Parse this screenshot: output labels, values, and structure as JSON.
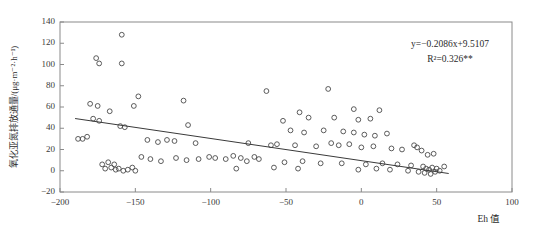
{
  "chart_data": {
    "type": "scatter",
    "title": "",
    "xlabel": "Eh 值",
    "ylabel": "氧化亚氮排放通量/(μg·m⁻²·h⁻¹)",
    "xlim": [
      -200,
      100
    ],
    "ylim": [
      -20,
      140
    ],
    "xticks": [
      -200,
      -150,
      -100,
      -50,
      0,
      50,
      100
    ],
    "xticklabels": [
      "−200",
      "−150",
      "−100",
      "−50",
      "0",
      "50",
      "100"
    ],
    "yticks": [
      -20,
      0,
      20,
      40,
      60,
      80,
      100,
      120,
      140
    ],
    "yticklabels": [
      "−20",
      "0",
      "20",
      "40",
      "60",
      "80",
      "100",
      "120",
      "140"
    ],
    "grid": false,
    "legend": null,
    "marker": "open-circle",
    "annotations": {
      "equation": "y=−0.2086x+9.5107",
      "r_squared": "R²=0.326**",
      "slope": -0.2086,
      "intercept": 9.5107,
      "r2": 0.326,
      "significance": "**"
    },
    "fit_line": {
      "type": "linear",
      "x_start": -190,
      "x_end": 58,
      "y_start": 49.15,
      "y_end": -2.59
    },
    "points": [
      {
        "x": -159,
        "y": 128
      },
      {
        "x": -176,
        "y": 106
      },
      {
        "x": -174,
        "y": 101
      },
      {
        "x": -159,
        "y": 101
      },
      {
        "x": -22,
        "y": 77
      },
      {
        "x": -63,
        "y": 75
      },
      {
        "x": -148,
        "y": 70
      },
      {
        "x": -118,
        "y": 66
      },
      {
        "x": -180,
        "y": 63
      },
      {
        "x": -175,
        "y": 61
      },
      {
        "x": -167,
        "y": 56
      },
      {
        "x": -151,
        "y": 61
      },
      {
        "x": -5,
        "y": 58
      },
      {
        "x": 12,
        "y": 57
      },
      {
        "x": -41,
        "y": 55
      },
      {
        "x": -178,
        "y": 49
      },
      {
        "x": -174,
        "y": 47
      },
      {
        "x": -115,
        "y": 43
      },
      {
        "x": -52,
        "y": 47
      },
      {
        "x": -35,
        "y": 50
      },
      {
        "x": -18,
        "y": 50
      },
      {
        "x": -2,
        "y": 48
      },
      {
        "x": 6,
        "y": 49
      },
      {
        "x": -160,
        "y": 42
      },
      {
        "x": -157,
        "y": 41
      },
      {
        "x": -47,
        "y": 38
      },
      {
        "x": -38,
        "y": 36
      },
      {
        "x": -25,
        "y": 38
      },
      {
        "x": -12,
        "y": 37
      },
      {
        "x": -5,
        "y": 36
      },
      {
        "x": 2,
        "y": 34
      },
      {
        "x": 9,
        "y": 33
      },
      {
        "x": 17,
        "y": 35
      },
      {
        "x": -185,
        "y": 30
      },
      {
        "x": -142,
        "y": 29
      },
      {
        "x": -135,
        "y": 27
      },
      {
        "x": -129,
        "y": 29
      },
      {
        "x": -124,
        "y": 28
      },
      {
        "x": -110,
        "y": 26
      },
      {
        "x": -75,
        "y": 26
      },
      {
        "x": -60,
        "y": 24
      },
      {
        "x": -56,
        "y": 25
      },
      {
        "x": -44,
        "y": 24
      },
      {
        "x": -30,
        "y": 23
      },
      {
        "x": -20,
        "y": 26
      },
      {
        "x": -15,
        "y": 24
      },
      {
        "x": -8,
        "y": 25
      },
      {
        "x": 0,
        "y": 22
      },
      {
        "x": 8,
        "y": 23
      },
      {
        "x": 20,
        "y": 21
      },
      {
        "x": 27,
        "y": 20
      },
      {
        "x": 35,
        "y": 24
      },
      {
        "x": 37,
        "y": 22
      },
      {
        "x": 40,
        "y": 19
      },
      {
        "x": 44,
        "y": 15
      },
      {
        "x": 48,
        "y": 16
      },
      {
        "x": -97,
        "y": 12
      },
      {
        "x": -90,
        "y": 11
      },
      {
        "x": -85,
        "y": 14
      },
      {
        "x": -80,
        "y": 12
      },
      {
        "x": -76,
        "y": 9
      },
      {
        "x": -71,
        "y": 13
      },
      {
        "x": -68,
        "y": 11
      },
      {
        "x": -123,
        "y": 12
      },
      {
        "x": -116,
        "y": 10
      },
      {
        "x": -108,
        "y": 11
      },
      {
        "x": -101,
        "y": 13
      },
      {
        "x": -140,
        "y": 11
      },
      {
        "x": -133,
        "y": 9
      },
      {
        "x": -146,
        "y": 13
      },
      {
        "x": -51,
        "y": 8
      },
      {
        "x": -39,
        "y": 9
      },
      {
        "x": -27,
        "y": 7
      },
      {
        "x": -13,
        "y": 7
      },
      {
        "x": 3,
        "y": 6
      },
      {
        "x": 14,
        "y": 7
      },
      {
        "x": 24,
        "y": 6
      },
      {
        "x": 33,
        "y": 5
      },
      {
        "x": 41,
        "y": 4
      },
      {
        "x": 43,
        "y": 2
      },
      {
        "x": 45,
        "y": 1
      },
      {
        "x": 47,
        "y": 3
      },
      {
        "x": 50,
        "y": 2
      },
      {
        "x": 55,
        "y": 4
      },
      {
        "x": -170,
        "y": 2
      },
      {
        "x": -166,
        "y": 3
      },
      {
        "x": -163,
        "y": 1
      },
      {
        "x": -161,
        "y": 2
      },
      {
        "x": -158,
        "y": 0
      },
      {
        "x": -155,
        "y": 1
      },
      {
        "x": -152,
        "y": 3
      },
      {
        "x": -150,
        "y": 0
      },
      {
        "x": -168,
        "y": 8
      },
      {
        "x": -172,
        "y": 6
      },
      {
        "x": -164,
        "y": 6
      },
      {
        "x": 31,
        "y": 0
      },
      {
        "x": 38,
        "y": -1
      },
      {
        "x": 42,
        "y": -2
      },
      {
        "x": 46,
        "y": -3
      },
      {
        "x": 49,
        "y": -1
      },
      {
        "x": 52,
        "y": 0
      },
      {
        "x": 19,
        "y": 1
      },
      {
        "x": -42,
        "y": 2
      },
      {
        "x": -58,
        "y": 3
      },
      {
        "x": -83,
        "y": 2
      },
      {
        "x": -2,
        "y": 1
      },
      {
        "x": 10,
        "y": 2
      },
      {
        "x": -182,
        "y": 32
      },
      {
        "x": -188,
        "y": 30
      }
    ]
  }
}
